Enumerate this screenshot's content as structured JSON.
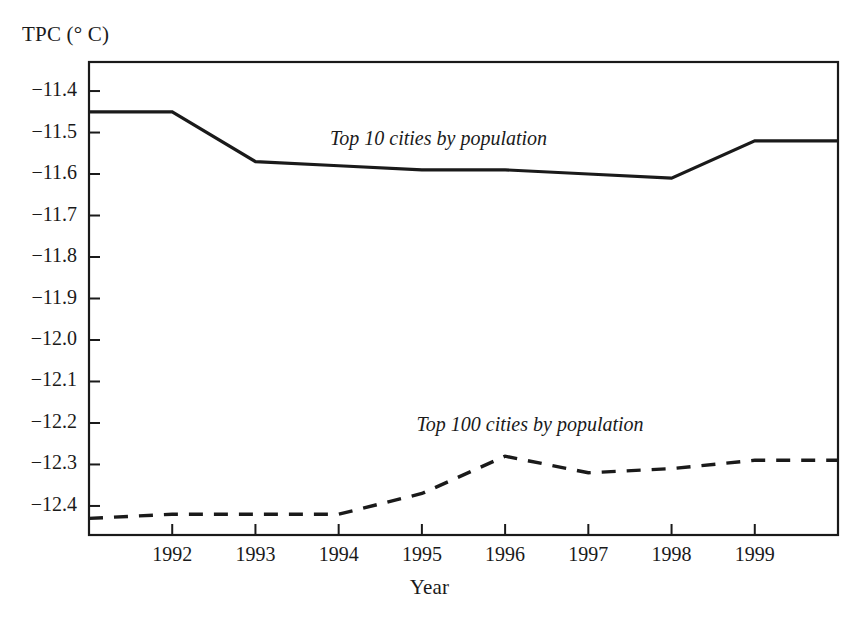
{
  "chart_data": {
    "type": "line",
    "title": "",
    "xlabel": "Year",
    "ylabel": "TPC (° C)",
    "xlim": [
      1991.0,
      2000.0
    ],
    "ylim": [
      -12.47,
      -11.33
    ],
    "grid": false,
    "legend_position": "inline-annotation",
    "x_ticks": [
      1992,
      1993,
      1994,
      1995,
      1996,
      1997,
      1998,
      1999
    ],
    "x_tick_labels": [
      "1992",
      "1993",
      "1994",
      "1995",
      "1996",
      "1997",
      "1998",
      "1999"
    ],
    "y_ticks": [
      -11.4,
      -11.5,
      -11.6,
      -11.7,
      -11.8,
      -11.9,
      -12.0,
      -12.1,
      -12.2,
      -12.3,
      -12.4
    ],
    "y_tick_labels": [
      "−11.4",
      "−11.5",
      "−11.6",
      "−11.7",
      "−11.8",
      "−11.9",
      "−12.0",
      "−12.1",
      "−12.2",
      "−12.3",
      "−12.4"
    ],
    "x": [
      1991,
      1992,
      1993,
      1994,
      1995,
      1996,
      1997,
      1998,
      1999,
      2000
    ],
    "series": [
      {
        "name": "Top 10 cities by population",
        "style": "solid",
        "color": "#1a1a1a",
        "values": [
          -11.45,
          -11.45,
          -11.57,
          -11.58,
          -11.59,
          -11.59,
          -11.6,
          -11.61,
          -11.52,
          -11.52
        ]
      },
      {
        "name": "Top 100 cities by population",
        "style": "dashed",
        "color": "#1a1a1a",
        "values": [
          -12.43,
          -12.42,
          -12.42,
          -12.42,
          -12.37,
          -12.28,
          -12.32,
          -12.31,
          -12.29,
          -12.29
        ]
      }
    ],
    "annotations": [
      {
        "text": "Top 10 cities by population",
        "x": 1995.2,
        "y": -11.52
      },
      {
        "text": "Top 100 cities by population",
        "x": 1996.3,
        "y": -12.21
      }
    ]
  }
}
